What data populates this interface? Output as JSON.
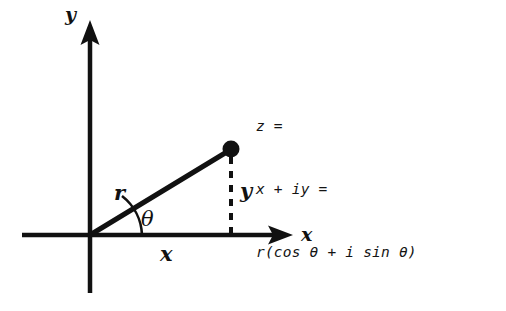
{
  "figure": {
    "background_color": "#ffffff",
    "ink_color": "#111111"
  },
  "axes": {
    "vertical_label": "y",
    "horizontal_label": "x",
    "origin_label": "",
    "vertical_arrow": "up-arrow",
    "horizontal_arrow": "right-arrow"
  },
  "diagram": {
    "point_name": "z-point",
    "radius_label": "r",
    "angle_label": "θ",
    "horizontal_leg_label": "x",
    "vertical_leg_label": "y",
    "vertical_leg_style": "dashed"
  },
  "equation": {
    "lines": [
      "z =",
      "x + iy =",
      "r(cos θ + i sin θ)"
    ],
    "line1": "z =",
    "line2": "x + iy =",
    "line3": "r(cos θ + i sin θ)"
  },
  "geometry": {
    "origin_x": 90,
    "origin_y": 235,
    "point_x": 231,
    "point_y": 149,
    "x_axis_left": 22,
    "x_axis_right": 293,
    "y_axis_top": 22,
    "y_axis_bottom": 293
  }
}
